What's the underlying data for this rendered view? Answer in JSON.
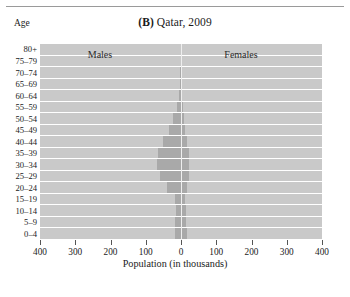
{
  "figure": {
    "panel_label": "(B)",
    "title_text": "Qatar, 2009",
    "y_axis_title": "Age",
    "x_axis_title": "Population (in thousands)",
    "males_label": "Males",
    "females_label": "Females"
  },
  "colors": {
    "plot_background": "#c9c9c9",
    "bar_fill": "#a9a9a9",
    "gridline": "#ffffff",
    "text": "#1b1b1b",
    "rule": "#9a9a9a"
  },
  "chart_data": {
    "type": "bar",
    "subtype": "population-pyramid",
    "title": "(B) Qatar, 2009",
    "xlabel": "Population (in thousands)",
    "ylabel": "Age",
    "xlim": [
      -400,
      400
    ],
    "xticks": [
      -400,
      -300,
      -200,
      -100,
      0,
      100,
      200,
      300,
      400
    ],
    "xticklabels": [
      "400",
      "300",
      "200",
      "100",
      "0",
      "100",
      "200",
      "300",
      "400"
    ],
    "grid": true,
    "legend": "inline-labels",
    "categories": [
      "80+",
      "75–79",
      "70–74",
      "65–69",
      "60–64",
      "55–59",
      "50–54",
      "45–49",
      "40–44",
      "35–39",
      "30–34",
      "25–29",
      "20–24",
      "15–19",
      "10–14",
      "5–9",
      "0–4"
    ],
    "series": [
      {
        "name": "Males",
        "direction": "left",
        "values": [
          1,
          1,
          2,
          3,
          6,
          12,
          22,
          35,
          52,
          66,
          68,
          60,
          40,
          17,
          15,
          16,
          17
        ]
      },
      {
        "name": "Females",
        "direction": "right",
        "values": [
          1,
          1,
          1,
          2,
          3,
          5,
          8,
          12,
          17,
          22,
          24,
          22,
          18,
          12,
          14,
          15,
          16
        ]
      }
    ]
  }
}
